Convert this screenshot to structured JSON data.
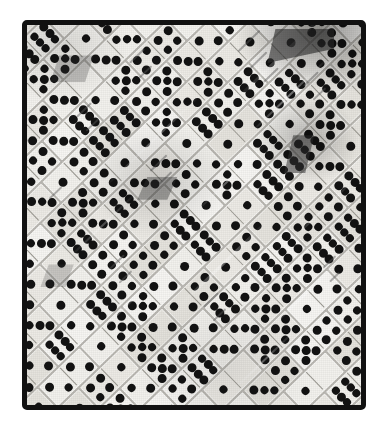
{
  "image": {
    "kind": "photograph",
    "subject": "dominoes",
    "description": "Black and white photograph of many white domino tiles with black pips, laid edge to edge in a diagonal herringbone grid filling the frame.",
    "orientation": "portrait",
    "color_mode": "grayscale",
    "frame": {
      "border_color": "#111111",
      "border_width_px": 5,
      "corner_radius_px": 5,
      "margin_color": "#ffffff",
      "left_px": 22,
      "top_px": 20,
      "width_px": 344,
      "height_px": 390
    },
    "palette": {
      "tile_face": "#f2f1ed",
      "tile_face_shaded": "#e5e3dd",
      "tile_edge": "#b9b7b1",
      "pip": "#121212",
      "shadow_patch": "#373737",
      "background": "#ffffff"
    },
    "tile_field": {
      "rotation_deg": -44,
      "tile_width_px": 58,
      "tile_height_px": 29,
      "pip_diameter_px": 9,
      "columns": 11,
      "rows": 21,
      "note": "Tiles read as 2x1 dominoes rotated roughly 45 degrees, tiled in offset rows."
    },
    "shadow_patches": [
      {
        "name": "top-right-wedge",
        "left_pct": 72,
        "top_pct": 1,
        "width_pct": 20,
        "height_pct": 9
      },
      {
        "name": "right-mid-wedge",
        "left_pct": 76,
        "top_pct": 29,
        "width_pct": 9,
        "height_pct": 9
      },
      {
        "name": "center-left-wedge",
        "left_pct": 33,
        "top_pct": 40,
        "width_pct": 11,
        "height_pct": 6
      },
      {
        "name": "upper-left-wedge",
        "left_pct": 8,
        "top_pct": 8,
        "width_pct": 12,
        "height_pct": 7
      }
    ],
    "pip_counts_observed": [
      1,
      2,
      3,
      4,
      5,
      6
    ],
    "caption": ""
  }
}
